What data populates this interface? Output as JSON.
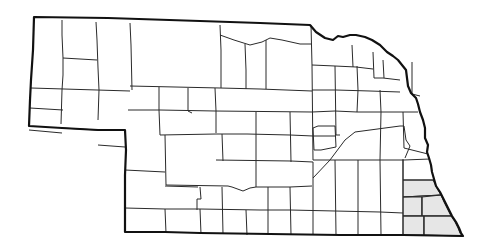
{
  "map": {
    "region": "Nebraska",
    "subdivision": "counties",
    "background_color": "#ffffff",
    "line_color": "#2a2a2a",
    "shade_color": "#e6e6e6",
    "shaded_counties": [
      "Otoe",
      "Johnson",
      "Nemaha",
      "Pawnee",
      "Richardson"
    ]
  }
}
